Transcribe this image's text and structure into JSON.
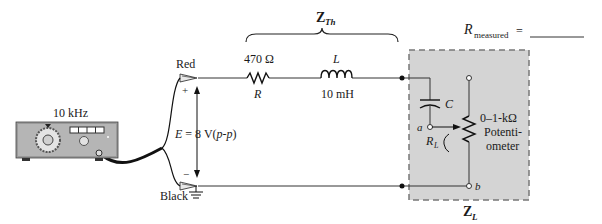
{
  "generator": {
    "frequency_label": "10 kHz"
  },
  "source": {
    "red_lead_label": "Red",
    "black_lead_label": "Black",
    "plus_sign": "+",
    "minus_sign": "−",
    "voltage_label_E": "E",
    "voltage_label_value": " = 8 V(",
    "voltage_label_pp": "p-p",
    "voltage_label_close": ")"
  },
  "thevenin": {
    "label_Z": "Z",
    "label_sub": "Th",
    "resistor_value": "470 Ω",
    "resistor_name": "R",
    "inductor_name": "L",
    "inductor_value": "10 mH"
  },
  "load": {
    "label_Z": "Z",
    "label_sub": "L",
    "capacitor_name": "C",
    "node_a": "a",
    "node_b": "b",
    "rl_label_R": "R",
    "rl_label_sub": "L",
    "pot_value": "0–1-kΩ",
    "pot_line1": "Potenti-",
    "pot_line2": "ometer",
    "box_fill": "#d4d4d4"
  },
  "measurement": {
    "label_R": "R",
    "label_sub": "measured",
    "equals": "="
  }
}
